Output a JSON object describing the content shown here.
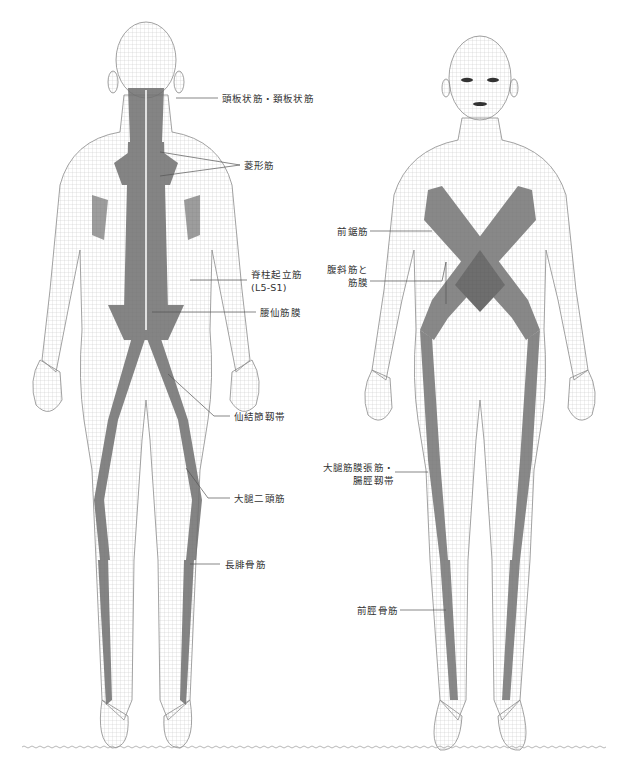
{
  "figure": {
    "title": "",
    "colors": {
      "mesh": "#b5b5b5",
      "outline": "#8a8a8a",
      "muscle": "#6f6f6f",
      "muscle_light": "#a8a8a8",
      "leader": "#555555",
      "text": "#333333"
    },
    "back_view": {
      "labels": [
        {
          "id": "splenius",
          "text": "頭板状筋・頚板状筋"
        },
        {
          "id": "rhomboid",
          "text": "菱形筋"
        },
        {
          "id": "erector",
          "line1": "脊柱起立筋",
          "line2": "(L5-S1)"
        },
        {
          "id": "lumbosacral",
          "text": "腰仙筋膜"
        },
        {
          "id": "sacrotuberous",
          "text": "仙結節靱帯"
        },
        {
          "id": "biceps_femoris",
          "text": "大腿二頭筋"
        },
        {
          "id": "peroneus_longus",
          "text": "長腓骨筋"
        }
      ]
    },
    "front_view": {
      "labels": [
        {
          "id": "serratus",
          "text": "前鋸筋"
        },
        {
          "id": "oblique",
          "line1": "腹斜筋と",
          "line2": "筋膜"
        },
        {
          "id": "tfl_itband",
          "line1": "大腿筋膜張筋・",
          "line2": "腸脛靱帯"
        },
        {
          "id": "tibialis_anterior",
          "text": "前脛骨筋"
        }
      ]
    }
  }
}
